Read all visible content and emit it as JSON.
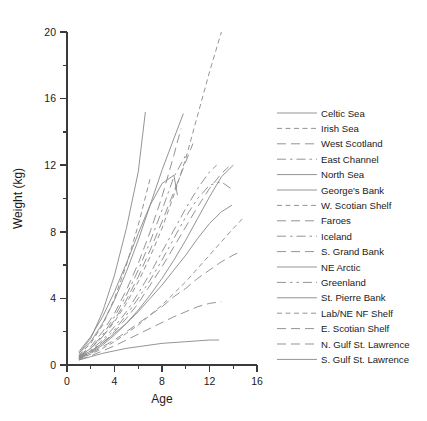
{
  "chart_data": {
    "type": "line",
    "title": "",
    "xlabel": "Age",
    "ylabel": "Weight (kg)",
    "xlim": [
      0,
      16
    ],
    "ylim": [
      0,
      20
    ],
    "xticks": [
      0,
      4,
      8,
      12,
      16
    ],
    "xtick_labels": [
      "0",
      "4",
      "8",
      "12",
      "16"
    ],
    "xminor_ticks": [
      2,
      6,
      10,
      14
    ],
    "yticks": [
      0,
      4,
      8,
      12,
      16,
      20
    ],
    "ytick_labels": [
      "0",
      "4",
      "8",
      "12",
      "16",
      "20"
    ],
    "yminor_ticks": [
      2,
      6,
      10,
      14,
      18
    ],
    "grid": false,
    "legend_position": "right",
    "line_color": "#8e8e8e",
    "series": [
      {
        "name": "Celtic Sea",
        "dash": "solid",
        "x": [
          1,
          2,
          3,
          4,
          5,
          6,
          6.6
        ],
        "values": [
          0.7,
          1.6,
          3.2,
          5.4,
          8.2,
          11.6,
          15.2
        ]
      },
      {
        "name": "Irish Sea",
        "dash": "dashed",
        "x": [
          1,
          2,
          3,
          4,
          5,
          6,
          7
        ],
        "values": [
          0.6,
          1.3,
          2.4,
          4.0,
          6.0,
          8.4,
          11.2
        ]
      },
      {
        "name": "West Scotland",
        "dash": "longdash",
        "x": [
          1,
          2,
          3,
          4,
          5,
          6,
          7,
          8,
          9,
          9.6
        ],
        "values": [
          0.55,
          1.1,
          2.0,
          3.1,
          4.5,
          6.1,
          8.0,
          10.1,
          12.6,
          14.2
        ]
      },
      {
        "name": "East Channel",
        "dash": "dashdot",
        "x": [
          1,
          2,
          3,
          4,
          5,
          6,
          7,
          8,
          9,
          10
        ],
        "values": [
          0.5,
          1.0,
          1.8,
          2.9,
          4.2,
          5.7,
          7.4,
          9.3,
          11.3,
          12.6
        ]
      },
      {
        "name": "North Sea",
        "dash": "solid",
        "x": [
          1,
          2,
          3,
          4,
          5,
          6,
          7,
          8,
          9,
          9.8
        ],
        "values": [
          0.7,
          1.4,
          2.5,
          3.9,
          5.6,
          7.5,
          9.6,
          11.7,
          13.6,
          15.1
        ]
      },
      {
        "name": "George's Bank",
        "dash": "solid",
        "x": [
          1,
          2,
          3,
          4,
          5,
          6,
          7,
          8,
          9,
          9.3
        ],
        "values": [
          0.8,
          1.7,
          2.9,
          4.4,
          6.1,
          7.9,
          9.6,
          10.9,
          11.4,
          10.2
        ]
      },
      {
        "name": "W. Scotian Shelf",
        "dash": "dashed",
        "x": [
          1,
          2,
          3,
          4,
          5,
          6,
          7,
          8,
          9,
          10,
          11,
          12,
          13
        ],
        "values": [
          0.5,
          1.0,
          1.7,
          2.6,
          3.7,
          5.0,
          6.5,
          8.2,
          10.2,
          12.4,
          15.0,
          17.6,
          20.0
        ]
      },
      {
        "name": "Faroes",
        "dash": "longdash",
        "x": [
          1,
          2,
          3,
          4,
          5,
          6,
          7,
          8,
          9,
          10,
          10.6
        ],
        "values": [
          0.5,
          1.0,
          1.7,
          2.7,
          3.9,
          5.3,
          6.9,
          8.6,
          10.4,
          12.2,
          13.3
        ]
      },
      {
        "name": "Iceland",
        "dash": "dashdot",
        "x": [
          1,
          2,
          3,
          4,
          5,
          6,
          7,
          8,
          9,
          10,
          11,
          12,
          12.6
        ],
        "values": [
          0.45,
          0.9,
          1.5,
          2.3,
          3.2,
          4.3,
          5.5,
          6.8,
          8.1,
          9.4,
          10.6,
          11.6,
          12.0
        ]
      },
      {
        "name": "S. Grand Bank",
        "dash": "longdash",
        "x": [
          1,
          2,
          3,
          4,
          5,
          6,
          7,
          8,
          9,
          10,
          11,
          12,
          13,
          13.6
        ],
        "values": [
          0.4,
          0.8,
          1.3,
          2.0,
          2.8,
          3.7,
          4.8,
          5.9,
          7.1,
          8.3,
          9.5,
          10.6,
          11.5,
          11.9
        ]
      },
      {
        "name": "NE Arctic",
        "dash": "solid",
        "x": [
          1,
          2,
          3,
          4,
          5,
          6,
          7,
          8,
          9,
          10,
          11,
          12,
          13,
          14
        ],
        "values": [
          0.4,
          0.75,
          1.2,
          1.8,
          2.5,
          3.3,
          4.2,
          5.2,
          6.3,
          7.5,
          8.8,
          10.1,
          11.3,
          12.0
        ]
      },
      {
        "name": "Greenland",
        "dash": "dashdotdot",
        "x": [
          1,
          2,
          3,
          4,
          5,
          6,
          7,
          8,
          9,
          10,
          11,
          12,
          13,
          13.8
        ],
        "values": [
          0.4,
          0.8,
          1.4,
          2.1,
          3.0,
          4.0,
          5.1,
          6.3,
          7.6,
          8.9,
          10.0,
          10.8,
          11.0,
          10.6
        ]
      },
      {
        "name": "St. Pierre Bank",
        "dash": "solid",
        "x": [
          1,
          2,
          3,
          4,
          5,
          6,
          7,
          8,
          9,
          10,
          11,
          12,
          13,
          13.9
        ],
        "values": [
          0.45,
          0.85,
          1.3,
          1.9,
          2.5,
          3.2,
          4.0,
          4.8,
          5.7,
          6.6,
          7.6,
          8.5,
          9.2,
          9.6
        ]
      },
      {
        "name": "Lab/NE NF Shelf",
        "dash": "dashed",
        "x": [
          1,
          2,
          3,
          4,
          5,
          6,
          7,
          8,
          9,
          10,
          11,
          12,
          13,
          14,
          14.8
        ],
        "values": [
          0.35,
          0.65,
          1.0,
          1.4,
          1.9,
          2.4,
          3.0,
          3.6,
          4.3,
          5.0,
          5.8,
          6.6,
          7.4,
          8.2,
          8.8
        ]
      },
      {
        "name": "E. Scotian Shelf",
        "dash": "longdash",
        "x": [
          1,
          2,
          3,
          4,
          5,
          6,
          7,
          8,
          9,
          10,
          11,
          12,
          13,
          14,
          14.6
        ],
        "values": [
          0.35,
          0.7,
          1.1,
          1.5,
          2.0,
          2.5,
          3.0,
          3.5,
          4.1,
          4.6,
          5.2,
          5.7,
          6.2,
          6.6,
          6.8
        ]
      },
      {
        "name": "N. Gulf St. Lawrence",
        "dash": "longdash",
        "x": [
          1,
          2,
          3,
          4,
          5,
          6,
          7,
          8,
          9,
          10,
          11,
          12,
          13
        ],
        "values": [
          0.3,
          0.55,
          0.85,
          1.15,
          1.5,
          1.85,
          2.2,
          2.55,
          2.9,
          3.2,
          3.5,
          3.7,
          3.8
        ]
      },
      {
        "name": "S. Gulf St. Lawrence",
        "dash": "solid",
        "x": [
          1,
          2,
          3,
          4,
          5,
          6,
          7,
          8,
          9,
          10,
          11,
          12,
          12.8
        ],
        "values": [
          0.3,
          0.5,
          0.7,
          0.85,
          1.0,
          1.1,
          1.2,
          1.3,
          1.35,
          1.4,
          1.45,
          1.5,
          1.5
        ]
      }
    ]
  }
}
